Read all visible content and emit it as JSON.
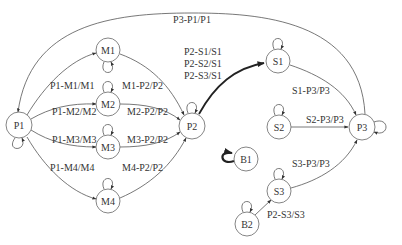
{
  "diagram": {
    "type": "state-transition-graph",
    "nodes": [
      {
        "id": "P1",
        "label": "P1",
        "x": 19,
        "y": 125,
        "r": 13,
        "self_loop": "bottom"
      },
      {
        "id": "M1",
        "label": "M1",
        "x": 108,
        "y": 50,
        "r": 12,
        "self_loop": "bottom"
      },
      {
        "id": "M2",
        "label": "M2",
        "x": 108,
        "y": 104,
        "r": 12,
        "self_loop": "top"
      },
      {
        "id": "M3",
        "label": "M3",
        "x": 108,
        "y": 147,
        "r": 12,
        "self_loop": "top"
      },
      {
        "id": "M4",
        "label": "M4",
        "x": 108,
        "y": 201,
        "r": 12,
        "self_loop": "top"
      },
      {
        "id": "P2",
        "label": "P2",
        "x": 192,
        "y": 126,
        "r": 13,
        "self_loop": "top"
      },
      {
        "id": "S1",
        "label": "S1",
        "x": 278,
        "y": 61,
        "r": 12,
        "self_loop": "top"
      },
      {
        "id": "S2",
        "label": "S2",
        "x": 279,
        "y": 127,
        "r": 12,
        "self_loop": "top"
      },
      {
        "id": "S3",
        "label": "S3",
        "x": 279,
        "y": 191,
        "r": 12,
        "self_loop": "top"
      },
      {
        "id": "P3",
        "label": "P3",
        "x": 362,
        "y": 127,
        "r": 13,
        "self_loop": "right"
      },
      {
        "id": "B1",
        "label": "B1",
        "x": 246,
        "y": 159,
        "r": 12,
        "self_loop": "left-bold"
      },
      {
        "id": "B2",
        "label": "B2",
        "x": 247,
        "y": 224,
        "r": 12,
        "self_loop": "top"
      }
    ],
    "edges": [
      {
        "from": "P3",
        "to": "P1",
        "label": "P3-P1/P1"
      },
      {
        "from": "P1",
        "to": "M1",
        "label": "P1-M1/M1"
      },
      {
        "from": "P1",
        "to": "M2",
        "label": "P1-M2/M2"
      },
      {
        "from": "P1",
        "to": "M3",
        "label": "P1-M3/M3"
      },
      {
        "from": "P1",
        "to": "M4",
        "label": "P1-M4/M4"
      },
      {
        "from": "M1",
        "to": "P2",
        "label": "M1-P2/P2"
      },
      {
        "from": "M2",
        "to": "P2",
        "label": "M2-P2/P2"
      },
      {
        "from": "M3",
        "to": "P2",
        "label": "M3-P2/P2"
      },
      {
        "from": "M4",
        "to": "P2",
        "label": "M4-P2/P2"
      },
      {
        "from": "P2",
        "to": "S1",
        "label_lines": [
          "P2-S1/S1",
          "P2-S2/S1",
          "P2-S3/S1"
        ],
        "bold": true
      },
      {
        "from": "S1",
        "to": "P3",
        "label": "S1-P3/P3"
      },
      {
        "from": "S2",
        "to": "P3",
        "label": "S2-P3/P3"
      },
      {
        "from": "S3",
        "to": "P3",
        "label": "S3-P3/P3"
      },
      {
        "from": "B2",
        "to": "S3",
        "label": "P2-S3/S3"
      }
    ]
  },
  "labels": {
    "p3_p1": "P3-P1/P1",
    "p1_m1": "P1-M1/M1",
    "p1_m2": "P1-M2/M2",
    "p1_m3": "P1-M3/M3",
    "p1_m4": "P1-M4/M4",
    "m1_p2": "M1-P2/P2",
    "m2_p2": "M2-P2/P2",
    "m3_p2": "M3-P2/P2",
    "m4_p2": "M4-P2/P2",
    "p2_s1_line1": "P2-S1/S1",
    "p2_s1_line2": "P2-S2/S1",
    "p2_s1_line3": "P2-S3/S1",
    "s1_p3": "S1-P3/P3",
    "s2_p3": "S2-P3/P3",
    "s3_p3": "S3-P3/P3",
    "b2_s3": "P2-S3/S3"
  },
  "nodes": {
    "P1": "P1",
    "M1": "M1",
    "M2": "M2",
    "M3": "M3",
    "M4": "M4",
    "P2": "P2",
    "S1": "S1",
    "S2": "S2",
    "S3": "S3",
    "P3": "P3",
    "B1": "B1",
    "B2": "B2"
  },
  "colors": {
    "background": "#ffffff",
    "stroke": "#555555",
    "node_stroke": "#777777",
    "text": "#333333",
    "bold_edge": "#222222"
  }
}
